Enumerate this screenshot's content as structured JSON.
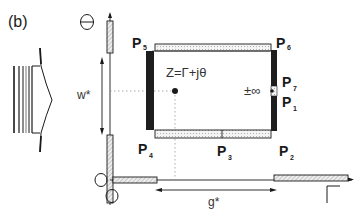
{
  "panel_label": "(b)",
  "axes": {
    "vertical_symbol": "Θ",
    "horizontal_symbol": "Γ",
    "origin_symbols": [
      "O",
      "O"
    ]
  },
  "dimensions": {
    "width_label": "w*",
    "gap_label": "g*"
  },
  "equation": "Z=Γ+jθ",
  "infinity_label": "±∞",
  "points": {
    "p1": {
      "letter": "P",
      "sub": "1"
    },
    "p2": {
      "letter": "P",
      "sub": "2"
    },
    "p3": {
      "letter": "P",
      "sub": "3"
    },
    "p4": {
      "letter": "P",
      "sub": "4"
    },
    "p5": {
      "letter": "P",
      "sub": "5"
    },
    "p6": {
      "letter": "P",
      "sub": "6"
    },
    "p7": {
      "letter": "P",
      "sub": "7"
    }
  },
  "colors": {
    "ink": "#1a1a1a",
    "electrode_fill": "#1e1e1e",
    "dotted_fill": "#e8e8e8",
    "hatch_fill": "#d8d8d8",
    "background": "#ffffff"
  }
}
